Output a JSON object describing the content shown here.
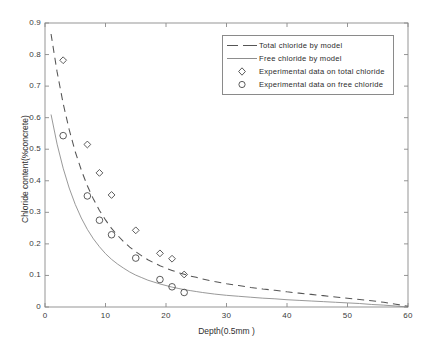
{
  "chart_data": {
    "type": "line",
    "title": "",
    "xlabel": "Depth(0.5mm )",
    "ylabel": "Chloride content(%concrete)",
    "xlim": [
      0,
      60
    ],
    "ylim": [
      0,
      0.9
    ],
    "xticks": [
      0,
      10,
      20,
      30,
      40,
      50,
      60
    ],
    "xtick_labels": [
      "0",
      "10",
      "20",
      "30",
      "40",
      "50",
      "60"
    ],
    "yticks": [
      0,
      0.1,
      0.2,
      0.3,
      0.4,
      0.5,
      0.6,
      0.7,
      0.8,
      0.9
    ],
    "ytick_labels": [
      "0",
      "0.1",
      "0.2",
      "0.3",
      "0.4",
      "0.5",
      "0.6",
      "0.7",
      "0.8",
      "0.9"
    ],
    "grid": false,
    "legend_position": "top-right",
    "series": [
      {
        "name": "Total chloride by model",
        "style": "dashed-line",
        "color": "#555555",
        "x": [
          1,
          2,
          3,
          4,
          5,
          6,
          7,
          8,
          9,
          10,
          11,
          12,
          13,
          14,
          15,
          16,
          17,
          18,
          19,
          20,
          21,
          22,
          23,
          24,
          25,
          26,
          28,
          30,
          32,
          34,
          36,
          38,
          40,
          42,
          44,
          46,
          48,
          50,
          52,
          54,
          56,
          58,
          60
        ],
        "y": [
          0.865,
          0.745,
          0.645,
          0.562,
          0.492,
          0.434,
          0.384,
          0.342,
          0.306,
          0.276,
          0.249,
          0.227,
          0.207,
          0.19,
          0.175,
          0.162,
          0.15,
          0.14,
          0.131,
          0.123,
          0.116,
          0.109,
          0.104,
          0.098,
          0.094,
          0.089,
          0.081,
          0.074,
          0.068,
          0.062,
          0.057,
          0.053,
          0.048,
          0.044,
          0.04,
          0.036,
          0.032,
          0.028,
          0.024,
          0.02,
          0.015,
          0.009,
          0.002
        ]
      },
      {
        "name": "Free chloride by model",
        "style": "solid-line",
        "color": "#8d8d8d",
        "x": [
          1,
          2,
          3,
          4,
          5,
          6,
          7,
          8,
          9,
          10,
          11,
          12,
          13,
          14,
          15,
          16,
          17,
          18,
          19,
          20,
          21,
          22,
          23,
          24,
          25,
          26,
          28,
          30,
          32,
          34,
          36,
          38,
          40,
          42,
          44,
          46,
          48,
          50,
          52,
          54,
          56,
          58,
          60
        ],
        "y": [
          0.61,
          0.516,
          0.44,
          0.377,
          0.325,
          0.282,
          0.246,
          0.216,
          0.191,
          0.169,
          0.151,
          0.136,
          0.123,
          0.111,
          0.101,
          0.093,
          0.085,
          0.079,
          0.073,
          0.068,
          0.063,
          0.059,
          0.055,
          0.052,
          0.049,
          0.046,
          0.041,
          0.037,
          0.034,
          0.031,
          0.028,
          0.026,
          0.023,
          0.021,
          0.019,
          0.017,
          0.015,
          0.013,
          0.011,
          0.008,
          0.006,
          0.003,
          0.0
        ]
      },
      {
        "name": "Experimental data on total chloride",
        "style": "diamond-marker",
        "color": "#4a4a4a",
        "x": [
          3,
          7,
          9,
          11,
          15,
          19,
          21,
          23
        ],
        "y": [
          0.782,
          0.515,
          0.425,
          0.355,
          0.243,
          0.17,
          0.153,
          0.103
        ]
      },
      {
        "name": "Experimental data on free chloride",
        "style": "circle-marker",
        "color": "#4a4a4a",
        "x": [
          3,
          7,
          9,
          11,
          15,
          19,
          21,
          23
        ],
        "y": [
          0.543,
          0.352,
          0.275,
          0.229,
          0.155,
          0.087,
          0.064,
          0.046
        ]
      }
    ]
  },
  "legend": {
    "entries": [
      {
        "label": "Total chloride by model",
        "marker": "dashed-line"
      },
      {
        "label": "Free chloride by model",
        "marker": "solid-line"
      },
      {
        "label": "Experimental data on total chloride",
        "marker": "diamond-marker"
      },
      {
        "label": "Experimental data on free chloride",
        "marker": "circle-marker"
      }
    ]
  },
  "axes": {
    "x_title": "Depth(0.5mm )",
    "y_title": "Chloride content(%concrete)"
  }
}
